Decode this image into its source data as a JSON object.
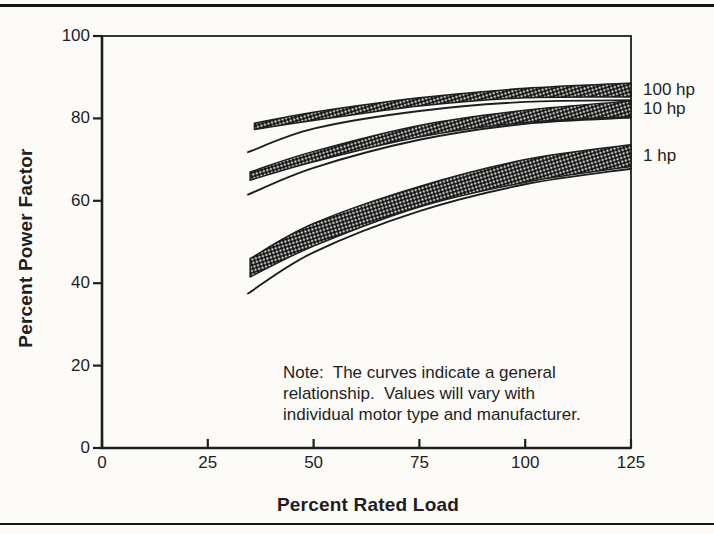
{
  "page": {
    "bg": "#fcfbf8",
    "ink": "#1e1e1e",
    "rule_color": "#161616",
    "pattern_dark": "#141414",
    "pattern_light": "#f6f6f4"
  },
  "chart_data": {
    "type": "area",
    "title": "",
    "xlabel": "Percent Rated Load",
    "ylabel": "Percent Power Factor",
    "xlim": [
      0,
      125
    ],
    "ylim": [
      0,
      100
    ],
    "xticks": [
      0,
      25,
      50,
      75,
      100,
      125
    ],
    "yticks": [
      0,
      20,
      40,
      60,
      80,
      100
    ],
    "grid": false,
    "frame": true,
    "legend_position": "right-of-plot",
    "note_lines": [
      "Note:  The curves indicate a general",
      "relationship.  Values will vary with",
      "individual motor type and manufacturer."
    ],
    "series": [
      {
        "name": "100 hp",
        "band_upper": {
          "x": [
            36,
            50,
            75,
            100,
            125
          ],
          "y": [
            78.8,
            81.5,
            85.0,
            87.3,
            88.6
          ]
        },
        "band_lower": {
          "x": [
            36,
            50,
            75,
            100,
            125
          ],
          "y": [
            77.3,
            79.5,
            83.0,
            85.0,
            85.2
          ]
        },
        "guide_line": {
          "x": [
            34.5,
            50,
            75,
            100,
            125
          ],
          "y": [
            71.8,
            77.5,
            81.8,
            84.0,
            84.4
          ]
        }
      },
      {
        "name": "10 hp",
        "band_upper": {
          "x": [
            35,
            50,
            75,
            100,
            125
          ],
          "y": [
            67.0,
            72.0,
            78.3,
            82.0,
            84.2
          ]
        },
        "band_lower": {
          "x": [
            35,
            50,
            75,
            100,
            125
          ],
          "y": [
            65.0,
            69.5,
            75.5,
            79.0,
            80.4
          ]
        },
        "guide_line": {
          "x": [
            34.5,
            50,
            75,
            100,
            125
          ],
          "y": [
            61.5,
            68.0,
            74.8,
            78.7,
            80.2
          ]
        }
      },
      {
        "name": "1 hp",
        "band_upper": {
          "x": [
            35,
            50,
            75,
            100,
            125
          ],
          "y": [
            46.0,
            54.5,
            63.5,
            70.0,
            73.6
          ]
        },
        "band_lower": {
          "x": [
            35,
            50,
            75,
            100,
            125
          ],
          "y": [
            41.5,
            49.0,
            58.5,
            64.5,
            68.3
          ]
        },
        "guide_line": {
          "x": [
            34.5,
            50,
            75,
            100,
            125
          ],
          "y": [
            37.5,
            47.5,
            57.5,
            64.0,
            67.8
          ]
        }
      }
    ]
  }
}
